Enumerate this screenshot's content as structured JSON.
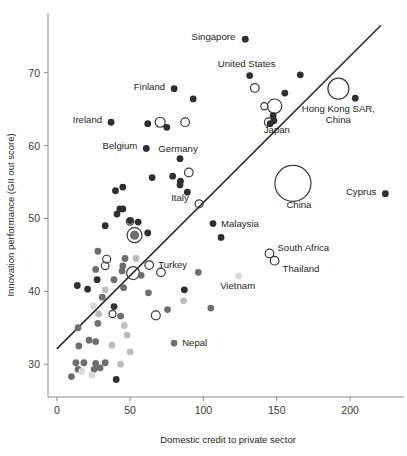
{
  "chart_data": {
    "type": "scatter",
    "title": "",
    "xlabel": "Domestic credit to private sector",
    "ylabel": "Innovation performance (GII out score)",
    "xlim": [
      -6,
      234
    ],
    "ylim": [
      25.5,
      77.5
    ],
    "xticks": [
      0,
      50,
      100,
      150,
      200
    ],
    "yticks": [
      30,
      40,
      50,
      60,
      70
    ],
    "grid": false,
    "legend": "none",
    "trendline": {
      "x0": 0,
      "y0": 32.1,
      "x1": 221,
      "y1": 76.5,
      "color": "#2b2b2b"
    },
    "marker_styles": {
      "filled_dark": "#2f2f2f",
      "filled_mid": "#6e6e6e",
      "filled_light": "#bdbdbd",
      "filled_pale": "#d9d9d9",
      "open": "#ffffff"
    },
    "labeled_points": [
      {
        "name": "Singapore",
        "x": 128.5,
        "y": 74.6,
        "r": 3.4,
        "style": "filled_dark",
        "label_dx": -10,
        "label_dy": 1,
        "anchor": "end"
      },
      {
        "name": "United States",
        "x": 131.5,
        "y": 69.6,
        "r": 3.4,
        "style": "filled_dark",
        "label_dx": -3,
        "label_dy": -9,
        "anchor": "middle"
      },
      {
        "name": "Finland",
        "x": 80.0,
        "y": 67.8,
        "r": 3.4,
        "style": "filled_dark",
        "label_dx": -9,
        "label_dy": 1,
        "anchor": "end"
      },
      {
        "name": "Hong Kong SAR, China",
        "x": 192.0,
        "y": 67.8,
        "r": 10.5,
        "style": "open",
        "label_dx": 0,
        "label_dy": 23,
        "anchor": "middle"
      },
      {
        "name": "Ireland",
        "x": 37.0,
        "y": 63.2,
        "r": 3.4,
        "style": "filled_dark",
        "label_dx": -9,
        "label_dy": 1,
        "anchor": "end"
      },
      {
        "name": "Japan",
        "x": 148.0,
        "y": 63.4,
        "r": 3.4,
        "style": "filled_dark",
        "label_dx": 3,
        "label_dy": 12,
        "anchor": "middle"
      },
      {
        "name": "Belgium",
        "x": 61.0,
        "y": 59.6,
        "r": 3.4,
        "style": "filled_dark",
        "label_dx": -9,
        "label_dy": 1,
        "anchor": "end"
      },
      {
        "name": "Germany",
        "x": 84.0,
        "y": 58.2,
        "r": 3.4,
        "style": "filled_dark",
        "label_dx": -2,
        "label_dy": -7,
        "anchor": "middle"
      },
      {
        "name": "China",
        "x": 161.0,
        "y": 54.8,
        "r": 18.0,
        "style": "open",
        "label_dx": 6,
        "label_dy": 25,
        "anchor": "middle"
      },
      {
        "name": "Cyprus",
        "x": 224.0,
        "y": 53.4,
        "r": 3.4,
        "style": "filled_dark",
        "label_dx": -9,
        "label_dy": 1,
        "anchor": "end"
      },
      {
        "name": "Italy",
        "x": 84.0,
        "y": 54.6,
        "r": 3.4,
        "style": "filled_dark",
        "label_dx": 0,
        "label_dy": 16,
        "anchor": "middle"
      },
      {
        "name": "Malaysia",
        "x": 106.5,
        "y": 49.3,
        "r": 3.4,
        "style": "filled_dark",
        "label_dx": 8,
        "label_dy": 3,
        "anchor": "start"
      },
      {
        "name": "South Africa",
        "x": 145.0,
        "y": 45.2,
        "r": 4.3,
        "style": "open",
        "label_dx": 8,
        "label_dy": -2,
        "anchor": "start"
      },
      {
        "name": "Thailand",
        "x": 148.5,
        "y": 44.2,
        "r": 4.3,
        "style": "open",
        "label_dx": 8,
        "label_dy": 11,
        "anchor": "start"
      },
      {
        "name": "Turkey",
        "x": 63.0,
        "y": 43.6,
        "r": 4.3,
        "style": "open",
        "label_dx": 9,
        "label_dy": 3,
        "anchor": "start"
      },
      {
        "name": "Vietnam",
        "x": 124.0,
        "y": 42.1,
        "r": 3.4,
        "style": "filled_pale",
        "label_dx": -1,
        "label_dy": 13,
        "anchor": "middle"
      },
      {
        "name": "Nepal",
        "x": 80.0,
        "y": 32.9,
        "r": 3.4,
        "style": "filled_mid",
        "label_dx": 8,
        "label_dy": 3,
        "anchor": "start"
      }
    ],
    "points": [
      {
        "x": 93.0,
        "y": 66.4,
        "r": 3.4,
        "style": "filled_dark"
      },
      {
        "x": 166.0,
        "y": 69.7,
        "r": 3.4,
        "style": "filled_dark"
      },
      {
        "x": 155.5,
        "y": 67.2,
        "r": 3.4,
        "style": "filled_dark"
      },
      {
        "x": 203.5,
        "y": 66.5,
        "r": 3.4,
        "style": "filled_dark"
      },
      {
        "x": 135.0,
        "y": 67.9,
        "r": 4.3,
        "style": "open"
      },
      {
        "x": 141.5,
        "y": 65.4,
        "r": 3.6,
        "style": "open"
      },
      {
        "x": 148.5,
        "y": 65.4,
        "r": 7.2,
        "style": "open"
      },
      {
        "x": 147.5,
        "y": 64.1,
        "r": 3.4,
        "style": "filled_dark"
      },
      {
        "x": 144.5,
        "y": 63.2,
        "r": 4.3,
        "style": "open"
      },
      {
        "x": 145.5,
        "y": 63.0,
        "r": 3.4,
        "style": "filled_dark"
      },
      {
        "x": 62.0,
        "y": 63.0,
        "r": 3.4,
        "style": "filled_dark"
      },
      {
        "x": 70.5,
        "y": 63.2,
        "r": 5.0,
        "style": "open"
      },
      {
        "x": 75.0,
        "y": 62.5,
        "r": 3.4,
        "style": "filled_dark"
      },
      {
        "x": 87.5,
        "y": 63.2,
        "r": 4.3,
        "style": "open"
      },
      {
        "x": 90.0,
        "y": 56.3,
        "r": 4.3,
        "style": "open"
      },
      {
        "x": 79.0,
        "y": 55.8,
        "r": 3.4,
        "style": "filled_dark"
      },
      {
        "x": 65.0,
        "y": 55.6,
        "r": 3.4,
        "style": "filled_dark"
      },
      {
        "x": 84.3,
        "y": 55.1,
        "r": 3.4,
        "style": "filled_dark"
      },
      {
        "x": 89.0,
        "y": 53.6,
        "r": 3.4,
        "style": "filled_dark"
      },
      {
        "x": 97.0,
        "y": 52.0,
        "r": 4.0,
        "style": "open"
      },
      {
        "x": 45.0,
        "y": 54.3,
        "r": 3.4,
        "style": "filled_dark"
      },
      {
        "x": 40.0,
        "y": 53.8,
        "r": 3.4,
        "style": "filled_dark"
      },
      {
        "x": 43.0,
        "y": 51.3,
        "r": 3.4,
        "style": "filled_dark"
      },
      {
        "x": 41.0,
        "y": 50.6,
        "r": 3.4,
        "style": "filled_dark"
      },
      {
        "x": 45.0,
        "y": 51.3,
        "r": 3.4,
        "style": "filled_dark"
      },
      {
        "x": 33.0,
        "y": 49.0,
        "r": 3.4,
        "style": "filled_dark"
      },
      {
        "x": 50.0,
        "y": 49.7,
        "r": 3.4,
        "style": "filled_dark"
      },
      {
        "x": 55.5,
        "y": 49.5,
        "r": 3.4,
        "style": "filled_dark"
      },
      {
        "x": 50.0,
        "y": 49.6,
        "r": 3.8,
        "style": "open"
      },
      {
        "x": 62.0,
        "y": 48.0,
        "r": 3.4,
        "style": "filled_dark"
      },
      {
        "x": 53.0,
        "y": 47.7,
        "r": 7.5,
        "style": "open"
      },
      {
        "x": 53.0,
        "y": 47.7,
        "r": 4.6,
        "style": "filled_mid"
      },
      {
        "x": 112.0,
        "y": 47.4,
        "r": 3.4,
        "style": "filled_dark"
      },
      {
        "x": 28.0,
        "y": 45.5,
        "r": 3.4,
        "style": "filled_mid"
      },
      {
        "x": 46.5,
        "y": 44.5,
        "r": 3.4,
        "style": "filled_mid"
      },
      {
        "x": 34.0,
        "y": 44.4,
        "r": 4.0,
        "style": "open"
      },
      {
        "x": 33.0,
        "y": 43.5,
        "r": 3.8,
        "style": "open"
      },
      {
        "x": 45.0,
        "y": 43.5,
        "r": 3.4,
        "style": "filled_mid"
      },
      {
        "x": 44.5,
        "y": 42.8,
        "r": 3.4,
        "style": "filled_mid"
      },
      {
        "x": 54.0,
        "y": 44.5,
        "r": 3.4,
        "style": "filled_light"
      },
      {
        "x": 52.0,
        "y": 42.5,
        "r": 6.5,
        "style": "open"
      },
      {
        "x": 26.5,
        "y": 43.0,
        "r": 3.4,
        "style": "filled_mid"
      },
      {
        "x": 71.0,
        "y": 42.6,
        "r": 4.3,
        "style": "open"
      },
      {
        "x": 96.5,
        "y": 42.6,
        "r": 3.4,
        "style": "filled_mid"
      },
      {
        "x": 27.5,
        "y": 41.6,
        "r": 3.4,
        "style": "filled_dark"
      },
      {
        "x": 39.0,
        "y": 41.6,
        "r": 3.4,
        "style": "filled_mid"
      },
      {
        "x": 57.5,
        "y": 42.2,
        "r": 3.4,
        "style": "filled_mid"
      },
      {
        "x": 14.0,
        "y": 40.8,
        "r": 3.4,
        "style": "filled_dark"
      },
      {
        "x": 21.0,
        "y": 40.3,
        "r": 3.4,
        "style": "filled_dark"
      },
      {
        "x": 33.0,
        "y": 40.2,
        "r": 3.4,
        "style": "filled_light"
      },
      {
        "x": 45.5,
        "y": 40.5,
        "r": 3.4,
        "style": "filled_mid"
      },
      {
        "x": 87.0,
        "y": 40.2,
        "r": 3.4,
        "style": "filled_dark"
      },
      {
        "x": 31.0,
        "y": 39.2,
        "r": 3.4,
        "style": "filled_mid"
      },
      {
        "x": 62.5,
        "y": 39.8,
        "r": 3.4,
        "style": "filled_mid"
      },
      {
        "x": 86.5,
        "y": 38.7,
        "r": 3.4,
        "style": "filled_light"
      },
      {
        "x": 39.0,
        "y": 37.9,
        "r": 3.4,
        "style": "filled_dark"
      },
      {
        "x": 105.0,
        "y": 37.7,
        "r": 3.4,
        "style": "filled_mid"
      },
      {
        "x": 75.5,
        "y": 37.5,
        "r": 3.4,
        "style": "filled_mid"
      },
      {
        "x": 25.0,
        "y": 38.0,
        "r": 3.4,
        "style": "filled_pale"
      },
      {
        "x": 28.5,
        "y": 36.9,
        "r": 3.4,
        "style": "filled_light"
      },
      {
        "x": 38.0,
        "y": 36.9,
        "r": 3.6,
        "style": "open"
      },
      {
        "x": 28.0,
        "y": 35.6,
        "r": 3.4,
        "style": "filled_mid"
      },
      {
        "x": 43.5,
        "y": 36.6,
        "r": 3.4,
        "style": "filled_mid"
      },
      {
        "x": 67.5,
        "y": 36.7,
        "r": 4.5,
        "style": "open"
      },
      {
        "x": 46.0,
        "y": 35.3,
        "r": 3.4,
        "style": "filled_light"
      },
      {
        "x": 14.5,
        "y": 35.0,
        "r": 3.4,
        "style": "filled_mid"
      },
      {
        "x": 48.0,
        "y": 34.0,
        "r": 3.4,
        "style": "filled_light"
      },
      {
        "x": 22.0,
        "y": 33.3,
        "r": 3.4,
        "style": "filled_mid"
      },
      {
        "x": 26.5,
        "y": 33.1,
        "r": 3.4,
        "style": "filled_mid"
      },
      {
        "x": 15.0,
        "y": 32.5,
        "r": 3.4,
        "style": "filled_mid"
      },
      {
        "x": 37.5,
        "y": 32.6,
        "r": 3.4,
        "style": "filled_light"
      },
      {
        "x": 50.0,
        "y": 31.7,
        "r": 3.4,
        "style": "filled_light"
      },
      {
        "x": 13.0,
        "y": 30.2,
        "r": 3.4,
        "style": "filled_mid"
      },
      {
        "x": 18.5,
        "y": 30.2,
        "r": 3.4,
        "style": "filled_mid"
      },
      {
        "x": 26.5,
        "y": 30.1,
        "r": 3.4,
        "style": "filled_mid"
      },
      {
        "x": 33.0,
        "y": 30.2,
        "r": 3.4,
        "style": "filled_mid"
      },
      {
        "x": 43.5,
        "y": 30.0,
        "r": 3.4,
        "style": "filled_light"
      },
      {
        "x": 14.5,
        "y": 29.3,
        "r": 3.4,
        "style": "filled_mid"
      },
      {
        "x": 17.0,
        "y": 29.0,
        "r": 3.4,
        "style": "filled_pale"
      },
      {
        "x": 25.5,
        "y": 29.3,
        "r": 3.4,
        "style": "filled_mid"
      },
      {
        "x": 29.5,
        "y": 29.5,
        "r": 3.4,
        "style": "filled_mid"
      },
      {
        "x": 24.0,
        "y": 28.5,
        "r": 3.4,
        "style": "filled_pale"
      },
      {
        "x": 10.0,
        "y": 28.3,
        "r": 3.4,
        "style": "filled_mid"
      },
      {
        "x": 40.5,
        "y": 27.9,
        "r": 3.4,
        "style": "filled_dark"
      }
    ]
  }
}
